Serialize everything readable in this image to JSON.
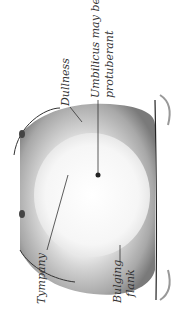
{
  "figure": {
    "labels": {
      "dullness": "Dullness",
      "umbilicus_line1": "Umbilicus may be",
      "umbilicus_line2": "protuberant",
      "tympany": "Tympany",
      "flank_line1": "Bulging",
      "flank_line2": "flank"
    }
  }
}
